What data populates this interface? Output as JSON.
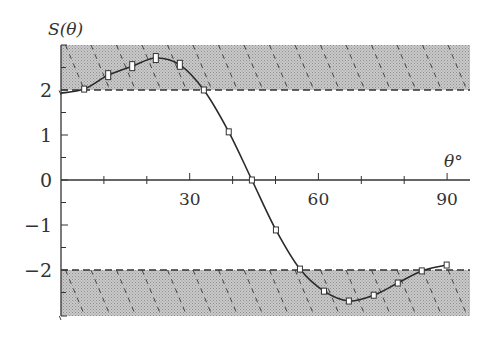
{
  "chart_data": {
    "type": "line",
    "title": "",
    "xlabel": "θ°",
    "ylabel": "S(θ)",
    "xlim": [
      0,
      95
    ],
    "ylim": [
      -3,
      3
    ],
    "x_ticks": [
      30,
      60,
      90
    ],
    "x_tick_labels": [
      "30",
      "60",
      "90"
    ],
    "y_ticks": [
      -2,
      -1,
      0,
      1,
      2
    ],
    "y_tick_labels": [
      "−2",
      "−1",
      "0",
      "1",
      "2"
    ],
    "grid": false,
    "shaded_regions": [
      {
        "name": "upper-forbidden",
        "y_from": 2,
        "y_to": 3,
        "pattern": "dotted gray with dashed diagonal hatch"
      },
      {
        "name": "lower-forbidden",
        "y_from": -3,
        "y_to": -2,
        "pattern": "dotted gray with dashed diagonal hatch"
      }
    ],
    "reference_lines": [
      {
        "y": 2,
        "style": "dashed"
      },
      {
        "y": -2,
        "style": "dashed"
      }
    ],
    "series": [
      {
        "name": "S(θ)",
        "style": "smooth curve with open rectangular markers",
        "x": [
          0,
          5.4,
          11.0,
          16.6,
          22.1,
          27.7,
          33.3,
          39.1,
          44.5,
          50.1,
          55.7,
          61.3,
          67.1,
          72.9,
          78.5,
          84.1,
          89.9
        ],
        "y": [
          1.93,
          2.02,
          2.33,
          2.53,
          2.71,
          2.56,
          2.0,
          1.07,
          0.0,
          -1.11,
          -1.98,
          -2.47,
          -2.69,
          -2.56,
          -2.29,
          -2.02,
          -1.89
        ]
      }
    ],
    "colors": {
      "axis": "#333333",
      "curve": "#2a2a2a",
      "shade": "#b8b8b8",
      "hatch": "#444444"
    }
  },
  "labels": {
    "y_axis_title": "S(θ)",
    "x_axis_title": "θ°"
  }
}
